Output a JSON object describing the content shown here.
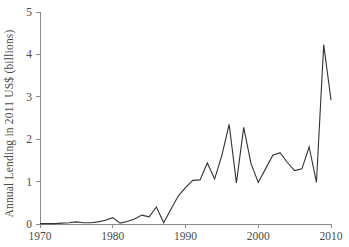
{
  "chart_data": {
    "type": "line",
    "title": "",
    "xlabel": "",
    "ylabel": "Annual Lending in 2011 US$ (billions)",
    "xlim": [
      1970,
      2010
    ],
    "ylim": [
      0,
      5
    ],
    "xticks": [
      1970,
      1980,
      1990,
      2000,
      2010
    ],
    "xtick_labels": [
      "1970",
      "1980",
      "1990",
      "2000",
      "2010"
    ],
    "yticks": [
      0,
      1,
      2,
      3,
      4,
      5
    ],
    "ytick_labels": [
      "0",
      "1",
      "2",
      "3",
      "4",
      "5"
    ],
    "grid": false,
    "legend": false,
    "series": [
      {
        "name": "Annual Lending",
        "color": "#333333",
        "x": [
          1970,
          1971,
          1972,
          1973,
          1974,
          1975,
          1976,
          1977,
          1978,
          1979,
          1980,
          1981,
          1982,
          1983,
          1984,
          1985,
          1986,
          1987,
          1988,
          1989,
          1990,
          1991,
          1992,
          1993,
          1994,
          1995,
          1996,
          1997,
          1998,
          1999,
          2000,
          2001,
          2002,
          2003,
          2004,
          2005,
          2006,
          2007,
          2008,
          2009,
          2010
        ],
        "values": [
          0.01,
          0.01,
          0.01,
          0.02,
          0.03,
          0.05,
          0.03,
          0.03,
          0.05,
          0.09,
          0.15,
          0.02,
          0.06,
          0.12,
          0.21,
          0.17,
          0.4,
          0.03,
          0.35,
          0.66,
          0.86,
          1.03,
          1.04,
          1.44,
          1.06,
          1.62,
          2.35,
          0.97,
          2.28,
          1.43,
          0.98,
          1.3,
          1.62,
          1.68,
          1.45,
          1.26,
          1.3,
          1.82,
          0.98,
          4.23,
          2.92
        ]
      }
    ],
    "axis_color": "#8a8a8a",
    "line_color": "#333333",
    "background": "#ffffff"
  },
  "geometry": {
    "plot_left": 40,
    "plot_right": 331,
    "plot_top": 12,
    "plot_bottom": 224,
    "tick_len": 4
  }
}
